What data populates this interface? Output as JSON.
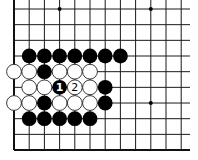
{
  "diagram": {
    "type": "go-board-fragment",
    "grid": {
      "columns": 12,
      "rows": 10,
      "origin_x": 14,
      "origin_y": 9,
      "spacing_x": 15.2,
      "spacing_y": 15.67,
      "line_extend_right": 190,
      "line_extend_top": 0,
      "edges": [
        "left",
        "bottom"
      ]
    },
    "colors": {
      "line": "#1a1a1a",
      "black_stone": "#000000",
      "white_stone": "#ffffff",
      "background": "#ffffff"
    },
    "hoshi": [
      {
        "col": 3,
        "row": 0
      },
      {
        "col": 9,
        "row": 0
      },
      {
        "col": 9,
        "row": 6
      }
    ],
    "stones": [
      {
        "color": "black",
        "col": 1,
        "row": 3
      },
      {
        "color": "black",
        "col": 2,
        "row": 3
      },
      {
        "color": "black",
        "col": 3,
        "row": 3
      },
      {
        "color": "black",
        "col": 4,
        "row": 3
      },
      {
        "color": "black",
        "col": 5,
        "row": 3
      },
      {
        "color": "black",
        "col": 6,
        "row": 3
      },
      {
        "color": "black",
        "col": 7,
        "row": 3
      },
      {
        "color": "white",
        "col": 0,
        "row": 4
      },
      {
        "color": "white",
        "col": 1,
        "row": 4
      },
      {
        "color": "black",
        "col": 2,
        "row": 4
      },
      {
        "color": "white",
        "col": 3,
        "row": 4
      },
      {
        "color": "white",
        "col": 4,
        "row": 4
      },
      {
        "color": "white",
        "col": 5,
        "row": 4
      },
      {
        "color": "white",
        "col": 1,
        "row": 5
      },
      {
        "color": "white",
        "col": 2,
        "row": 5
      },
      {
        "color": "black",
        "col": 3,
        "row": 5,
        "label": "1"
      },
      {
        "color": "white",
        "col": 4,
        "row": 5,
        "label": "2"
      },
      {
        "color": "white",
        "col": 5,
        "row": 5
      },
      {
        "color": "black",
        "col": 6,
        "row": 5
      },
      {
        "color": "white",
        "col": 0,
        "row": 6
      },
      {
        "color": "white",
        "col": 1,
        "row": 6
      },
      {
        "color": "black",
        "col": 2,
        "row": 6
      },
      {
        "color": "white",
        "col": 3,
        "row": 6
      },
      {
        "color": "white",
        "col": 4,
        "row": 6
      },
      {
        "color": "white",
        "col": 5,
        "row": 6
      },
      {
        "color": "black",
        "col": 6,
        "row": 6
      },
      {
        "color": "black",
        "col": 1,
        "row": 7
      },
      {
        "color": "black",
        "col": 2,
        "row": 7
      },
      {
        "color": "black",
        "col": 3,
        "row": 7
      },
      {
        "color": "black",
        "col": 4,
        "row": 7
      },
      {
        "color": "black",
        "col": 5,
        "row": 7
      }
    ],
    "move_labels": [
      "1",
      "2"
    ]
  }
}
